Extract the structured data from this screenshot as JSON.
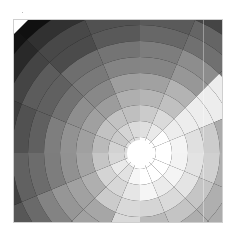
{
  "image": {
    "description": "Grayscale polar segmented pattern: concentric rings split into angular sectors, brightening toward a white center, with a bright wedge pointing upper-right",
    "center": {
      "x": 126,
      "y": 133
    },
    "ring_step": 16,
    "ring_count": 12,
    "sector_count": 16,
    "colors": {
      "center": "#ffffff",
      "outer": "#0a0a0a",
      "wedge": "#f4f4f4",
      "frame_border": "#cfcfcf"
    }
  }
}
